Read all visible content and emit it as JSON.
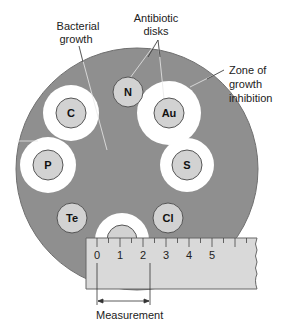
{
  "figure": {
    "colors": {
      "plate": "#8f8f8f",
      "plate_edge": "#6f6f6f",
      "inhibition_zone": "#ffffff",
      "disk_fill": "#d2d2d2",
      "disk_edge": "#555555",
      "ruler_fill": "#d9d9d9",
      "ruler_edge": "#666666",
      "text": "#222222"
    }
  },
  "labels": {
    "bacterial_growth": [
      "Bacterial",
      "growth"
    ],
    "antibiotic_disks": [
      "Antibiotic",
      "disks"
    ],
    "zone_of_inhibition": [
      "Zone of",
      "growth",
      "inhibition"
    ],
    "measurement": "Measurement"
  },
  "disks": [
    {
      "label": "N",
      "cx": 128,
      "cy": 92,
      "zone_r": 0
    },
    {
      "label": "C",
      "cx": 71,
      "cy": 113,
      "zone_r": 28
    },
    {
      "label": "Au",
      "cx": 169,
      "cy": 113,
      "zone_r": 32
    },
    {
      "label": "P",
      "cx": 48,
      "cy": 165,
      "zone_r": 28
    },
    {
      "label": "S",
      "cx": 187,
      "cy": 165,
      "zone_r": 27
    },
    {
      "label": "Te",
      "cx": 72,
      "cy": 218,
      "zone_r": 0
    },
    {
      "label": "Cl",
      "cx": 168,
      "cy": 218,
      "zone_r": 0
    },
    {
      "label": "",
      "cx": 122,
      "cy": 240,
      "zone_r": 27
    }
  ],
  "ruler": {
    "tick_labels": [
      "0",
      "1",
      "2",
      "3",
      "4",
      "5"
    ],
    "units": "cm",
    "measurement_span": [
      0,
      2.3
    ]
  }
}
